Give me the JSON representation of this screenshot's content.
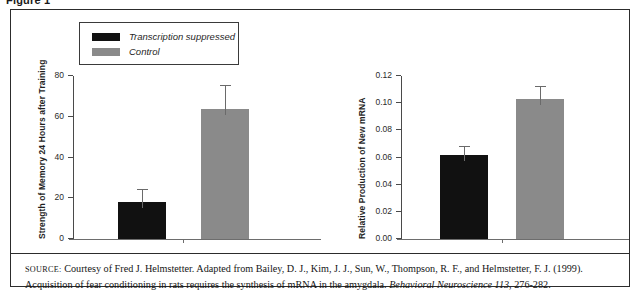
{
  "figure": {
    "label": "Figure 1"
  },
  "legend": {
    "items": [
      {
        "label": "Transcription suppressed",
        "color": "#111111",
        "swatch_name": "legend-swatch-transcription-suppressed"
      },
      {
        "label": "Control",
        "color": "#8a8a8a",
        "swatch_name": "legend-swatch-control"
      }
    ]
  },
  "caption": {
    "source_prefix": "Source:",
    "text_part1": " Courtesy of Fred J. Helmstetter. Adapted from Bailey, D. J., Kim, J. J., Sun, W., Thompson, R. F., and Helmstetter, F. J. (1999). Acquisition of fear conditioning in rats requires the synthesis of mRNA in the amygdala. ",
    "journal": "Behavioral Neuroscience 113",
    "text_part2": ", 276-282."
  },
  "chart_data": [
    {
      "id": "left",
      "type": "bar",
      "title": "",
      "xlabel": "",
      "ylabel": "Strength of Memory 24 Hours after Training",
      "ylim": [
        0,
        80
      ],
      "yticks": [
        0,
        20,
        40,
        60,
        80
      ],
      "ytick_labels": [
        "0",
        "20",
        "40",
        "60",
        "80"
      ],
      "grid": false,
      "categories": [
        "Transcription suppressed",
        "Control"
      ],
      "values": [
        18,
        64
      ],
      "errors": [
        6,
        11
      ],
      "colors": [
        "#111111",
        "#8a8a8a"
      ]
    },
    {
      "id": "right",
      "type": "bar",
      "title": "",
      "xlabel": "",
      "ylabel": "Relative Production of New mRNA",
      "ylim": [
        0.0,
        0.12
      ],
      "yticks": [
        0.0,
        0.02,
        0.04,
        0.06,
        0.08,
        0.1,
        0.12
      ],
      "ytick_labels": [
        "0.00",
        "0.02",
        "0.04",
        "0.06",
        "0.08",
        "0.10",
        "0.12"
      ],
      "grid": false,
      "categories": [
        "Transcription suppressed",
        "Control"
      ],
      "values": [
        0.062,
        0.103
      ],
      "errors": [
        0.006,
        0.009
      ],
      "colors": [
        "#111111",
        "#8a8a8a"
      ]
    }
  ]
}
